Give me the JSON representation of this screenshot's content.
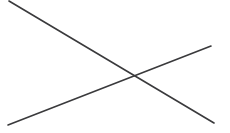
{
  "canvas": {
    "width": 230,
    "height": 133,
    "background_color": "#ffffff",
    "title": "X Mark Drawing"
  },
  "chart_data": {
    "type": "line",
    "title": "",
    "subtitle": "",
    "xlabel": "",
    "ylabel": "",
    "grid": false,
    "legend_position": "none",
    "xlim": [
      0,
      230
    ],
    "ylim": [
      0,
      133
    ],
    "annotations": [],
    "series": [
      {
        "name": "descending-stroke",
        "stroke_color": "#3a3a3c",
        "stroke_width": 1.6,
        "x": [
          9,
          214
        ],
        "y": [
          1,
          123
        ]
      },
      {
        "name": "ascending-stroke",
        "stroke_color": "#3a3a3c",
        "stroke_width": 1.6,
        "x": [
          8,
          211
        ],
        "y": [
          125,
          46
        ]
      }
    ],
    "intersection": {
      "x": 136,
      "y": 78
    }
  },
  "strokes": [
    {
      "id": "descending-stroke",
      "label": "Descending diagonal stroke",
      "start": {
        "x": 9,
        "y": 1
      },
      "end": {
        "x": 214,
        "y": 123
      },
      "color": "#3a3a3c",
      "width": 1.6
    },
    {
      "id": "ascending-stroke",
      "label": "Ascending diagonal stroke",
      "start": {
        "x": 8,
        "y": 125
      },
      "end": {
        "x": 211,
        "y": 46
      },
      "color": "#3a3a3c",
      "width": 1.6
    }
  ]
}
